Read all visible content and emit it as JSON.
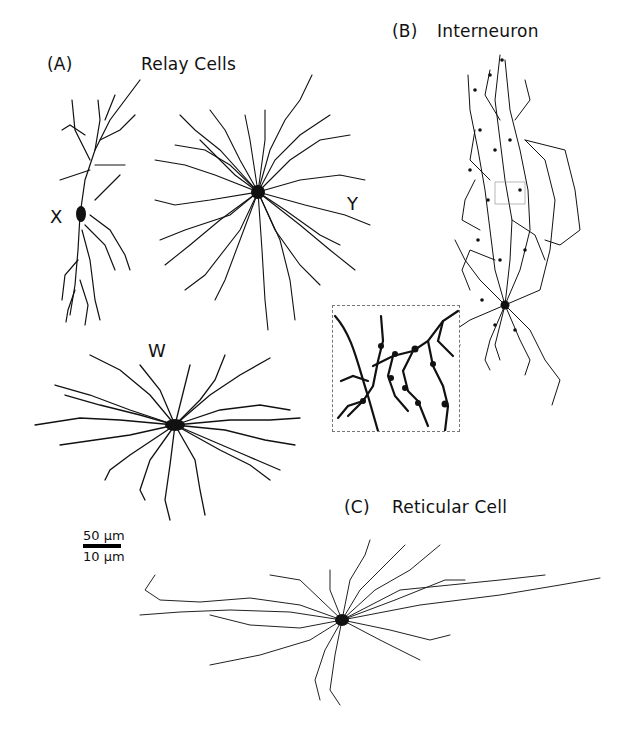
{
  "figure": {
    "panels": [
      {
        "id": "A",
        "tag": "(A)",
        "title": "Relay Cells",
        "cells": [
          {
            "label": "X"
          },
          {
            "label": "Y"
          },
          {
            "label": "W"
          }
        ]
      },
      {
        "id": "B",
        "tag": "(B)",
        "title": "Interneuron",
        "inset": {
          "description": "magnified dendritic region with boutons"
        }
      },
      {
        "id": "C",
        "tag": "(C)",
        "title": "Reticular Cell"
      }
    ],
    "scale_bar": {
      "top_label": "50 µm",
      "bottom_label": "10 µm"
    },
    "colors": {
      "ink": "#111111",
      "background": "#ffffff",
      "inset_border": "#777777"
    }
  }
}
